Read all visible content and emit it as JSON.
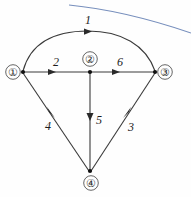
{
  "figure": {
    "type": "directed-graph-diagram",
    "background_color": "#fefefe",
    "ink_color": "#3a3a3a",
    "artifact_color": "#6f88b8"
  },
  "nodes": [
    {
      "id": "n1",
      "label": "①",
      "number": 1,
      "label_x": 13,
      "label_y": 72,
      "vertex_x": 23,
      "vertex_y": 72
    },
    {
      "id": "n2",
      "label": "②",
      "number": 2,
      "label_x": 90,
      "label_y": 59,
      "vertex_x": 90,
      "vertex_y": 72
    },
    {
      "id": "n3",
      "label": "③",
      "number": 3,
      "label_x": 165,
      "label_y": 72,
      "vertex_x": 155,
      "vertex_y": 72
    },
    {
      "id": "n4",
      "label": "④",
      "number": 4,
      "label_x": 91,
      "label_y": 182,
      "vertex_x": 90,
      "vertex_y": 171
    }
  ],
  "edges": [
    {
      "id": "e1",
      "from": "n1",
      "to": "n3",
      "label": "1",
      "shape": "arc",
      "label_x": 88,
      "label_y": 20
    },
    {
      "id": "e2",
      "from": "n1",
      "to": "n2",
      "label": "2",
      "shape": "line",
      "label_x": 56,
      "label_y": 62
    },
    {
      "id": "e6",
      "from": "n2",
      "to": "n3",
      "label": "6",
      "shape": "line",
      "label_x": 120,
      "label_y": 62
    },
    {
      "id": "e4",
      "from": "n1",
      "to": "n4",
      "label": "4",
      "shape": "line",
      "label_x": 48,
      "label_y": 127
    },
    {
      "id": "e5",
      "from": "n2",
      "to": "n4",
      "label": "5",
      "shape": "line",
      "label_x": 98,
      "label_y": 124
    },
    {
      "id": "e3",
      "from": "n3",
      "to": "n4",
      "label": "3",
      "shape": "line",
      "label_x": 130,
      "label_y": 129
    }
  ],
  "labels": {
    "node_1": "①",
    "node_2": "②",
    "node_3": "③",
    "node_4": "④",
    "edge_1": "1",
    "edge_2": "2",
    "edge_3": "3",
    "edge_4": "4",
    "edge_5": "5",
    "edge_6": "6"
  }
}
